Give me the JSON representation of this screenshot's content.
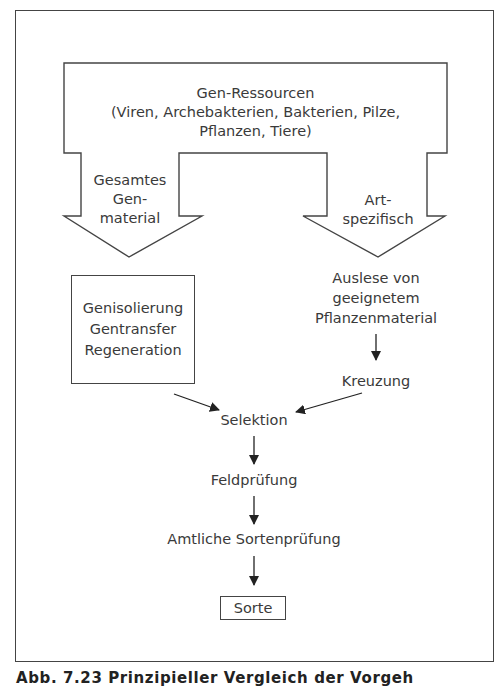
{
  "diagram": {
    "top_block": {
      "title": "Gen-Ressourcen",
      "line2": "(Viren, Archebakterien, Bakterien, Pilze,",
      "line3": "Pflanzen, Tiere)"
    },
    "left_arrow": {
      "line1": "Gesamtes",
      "line2": "Gen-",
      "line3": "material"
    },
    "right_arrow": {
      "line1": "Art-",
      "line2": "spezifisch"
    },
    "left_box": {
      "line1": "Genisolierung",
      "line2": "Gentransfer",
      "line3": "Regeneration"
    },
    "right_branch": {
      "selection_line1": "Auslese von",
      "selection_line2": "geeignetem",
      "selection_line3": "Pflanzenmaterial",
      "crossing": "Kreuzung"
    },
    "steps": {
      "selektion": "Selektion",
      "feldpruefung": "Feldprüfung",
      "amtlich": "Amtliche Sortenprüfung",
      "sorte": "Sorte"
    }
  },
  "caption": "Abb. 7.23   Prinzipieller Vergleich der Vorgeh"
}
